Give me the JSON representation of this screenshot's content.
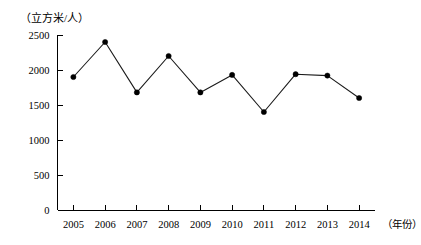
{
  "chart_data": {
    "type": "line",
    "title": "",
    "subtitle": "",
    "xlabel": "（年份）",
    "ylabel": "（立方米/人）",
    "categories": [
      "2005",
      "2006",
      "2007",
      "2008",
      "2009",
      "2010",
      "2011",
      "2012",
      "2013",
      "2014"
    ],
    "values": [
      1900,
      2400,
      1680,
      2200,
      1680,
      1930,
      1400,
      1940,
      1920,
      1600
    ],
    "series": [
      {
        "name": "人均水资源量",
        "values": [
          1900,
          2400,
          1680,
          2200,
          1680,
          1930,
          1400,
          1940,
          1920,
          1600
        ]
      }
    ],
    "ylim": [
      0,
      2500
    ],
    "ytick_labels": [
      "0",
      "500",
      "1000",
      "1500",
      "2000",
      "2500"
    ],
    "ytick_values": [
      0,
      500,
      1000,
      1500,
      2000,
      2500
    ],
    "xtick_labels": [
      "2005",
      "2006",
      "2007",
      "2008",
      "2009",
      "2010",
      "2011",
      "2012",
      "2013",
      "2014"
    ],
    "grid": false,
    "legend": false,
    "legend_position": "none",
    "marker": "filled-circle",
    "line_color": "#1a1a1a",
    "marker_color": "#000000",
    "axis_color": "#000000",
    "background_color": "#ffffff"
  }
}
